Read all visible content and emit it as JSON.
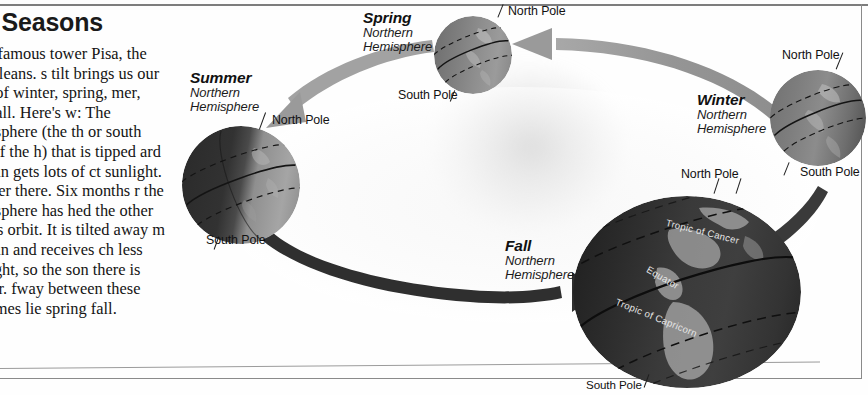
{
  "page": {
    "headline": "he Seasons",
    "paragraphs": [
      "e the famous tower Pisa, the earth leans. s tilt brings us our sons of winter, spring, mer, and fall. Here's w: The hemisphere (the th or south half of the h) that is tipped ard the sun gets lots of ct sunlight. It's mer there. Six months r the hemisphere has hed the other side ts orbit. It is tilted away m the sun and receives ch less sunlight, so the son there is winter. fway between these extremes lie spring fall."
    ]
  },
  "diagram": {
    "title_implied": "The Seasons",
    "sun_label": "sun-glow",
    "seasons": [
      {
        "id": "summer",
        "name": "Summer",
        "subtitle_line1": "Northern",
        "subtitle_line2": "Hemisphere",
        "north_pole_label": "North Pole",
        "south_pole_label": "South Pole"
      },
      {
        "id": "spring",
        "name": "Spring",
        "subtitle_line1": "Northern",
        "subtitle_line2": "Hemisphere",
        "north_pole_label": "North Pole",
        "south_pole_label": "South Pole"
      },
      {
        "id": "winter",
        "name": "Winter",
        "subtitle_line1": "Northern",
        "subtitle_line2": "Hemisphere",
        "north_pole_label": "North Pole",
        "south_pole_label": "South Pole"
      },
      {
        "id": "fall",
        "name": "Fall",
        "subtitle_line1": "Northern",
        "subtitle_line2": "Hemisphere",
        "north_pole_label": "North Pole",
        "south_pole_label": "South Pole",
        "latitude_labels": [
          "Tropic of Cancer",
          "Equator",
          "Tropic of Capricorn"
        ]
      }
    ],
    "extra_pole_labels": {
      "winter_lower_north": "North Pole"
    },
    "arrows": [
      {
        "id": "orbit-arrow-upper",
        "direction": "leftward",
        "color": "#9a9a9a"
      },
      {
        "id": "orbit-arrow-lower",
        "direction": "rightward",
        "color": "#2f2f2f"
      }
    ],
    "colors": {
      "arrow_gray": "#9a9a9a",
      "arrow_dark": "#2f2f2f",
      "globe_dark": "#3b3b3b",
      "globe_light": "#8d8d8d",
      "rule": "#8a8a8a",
      "text": "#111111"
    }
  }
}
